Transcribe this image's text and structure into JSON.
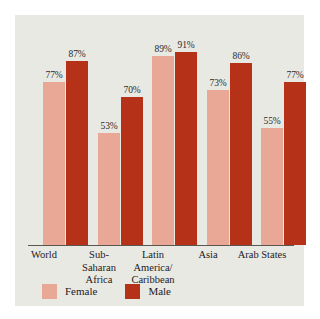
{
  "chart_data": {
    "type": "bar",
    "title": "",
    "subtitle": "",
    "xlabel": "",
    "ylabel": "",
    "ylim": [
      0,
      100
    ],
    "grid": false,
    "legend_position": "bottom-left",
    "categories": [
      "World",
      "Sub-Saharan Africa",
      "Latin America/Caribbean",
      "Asia",
      "Arab States"
    ],
    "category_lines": [
      [
        "World"
      ],
      [
        "Sub-",
        "Saharan",
        "Africa"
      ],
      [
        "Latin",
        "America/",
        "Caribbean"
      ],
      [
        "Asia"
      ],
      [
        "Arab States"
      ]
    ],
    "series": [
      {
        "name": "Female",
        "color": "#e9a795",
        "values": [
          77,
          53,
          89,
          73,
          55
        ],
        "labels": [
          "77%",
          "53%",
          "89%",
          "73%",
          "55%"
        ]
      },
      {
        "name": "Male",
        "color": "#b53118",
        "values": [
          87,
          70,
          91,
          86,
          77
        ],
        "labels": [
          "87%",
          "70%",
          "91%",
          "86%",
          "77%"
        ]
      }
    ]
  },
  "legend": {
    "items": [
      {
        "label": "Female",
        "color": "#e9a795"
      },
      {
        "label": "Male",
        "color": "#b53118"
      }
    ]
  },
  "panel": {
    "background": "#e9e9e4",
    "axis_color": "#5a5650"
  }
}
